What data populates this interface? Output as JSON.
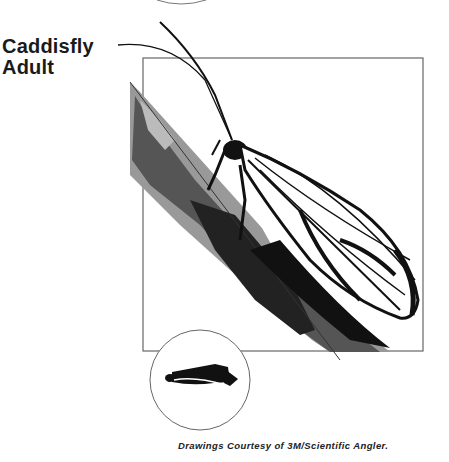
{
  "figure": {
    "title_line1": "Caddisfly",
    "title_line2": "Adult",
    "caption": "Drawings Courtesy of 3M/Scientific Angler.",
    "illustration": "caddisfly-adult-on-twig",
    "silhouette_icon": "caddisfly-silhouette-icon"
  }
}
